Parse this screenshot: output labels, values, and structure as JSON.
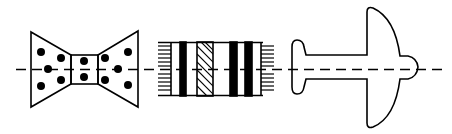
{
  "diagram": {
    "stroke_color": "#000000",
    "background": "#ffffff",
    "axis_y": 69,
    "shapes": [
      {
        "name": "bowtie",
        "dots": 12
      },
      {
        "name": "striped-rectangle",
        "stripe_types": [
          "horizontal-hatch",
          "solid-bar",
          "diagonal-hatch",
          "solid-bar",
          "solid-bar",
          "horizontal-hatch"
        ]
      },
      {
        "name": "airplane"
      }
    ]
  }
}
